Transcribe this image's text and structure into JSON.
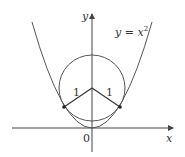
{
  "diagram": {
    "curve_label": "y = x",
    "curve_exponent": "2",
    "x_axis_label": "x",
    "y_axis_label": "y",
    "origin_label": "0",
    "radius_label_left": "1",
    "radius_label_right": "1",
    "colors": {
      "curve": "#555555",
      "axes": "#444444",
      "text": "#333333",
      "points": "#222222"
    }
  }
}
